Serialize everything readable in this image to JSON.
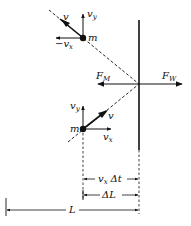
{
  "diagram": {
    "type": "physics-free-body",
    "labels": {
      "mass_top": "m",
      "mass_bottom": "m",
      "velocity": "v",
      "vy": "v",
      "vy_sub": "y",
      "neg_vx_prefix": "−",
      "vx": "v",
      "vx_sub": "x",
      "force_m": "F",
      "force_m_sub": "M",
      "force_w": "F",
      "force_w_sub": "W",
      "dim_vxdt_v": "v",
      "dim_vxdt_sub": "x",
      "dim_vxdt_dt": "Δt",
      "dim_dL": "ΔL",
      "dim_L": "L"
    },
    "colors": {
      "ink": "#111111",
      "background": "#ffffff"
    }
  }
}
